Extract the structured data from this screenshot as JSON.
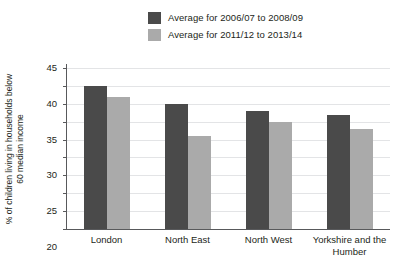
{
  "chart_data": {
    "type": "bar",
    "title": "",
    "xlabel": "",
    "ylabel": "% of children living in households below 60 median income",
    "ylim": [
      0,
      45
    ],
    "ytick_step": 5,
    "yticks": [
      "45",
      "40",
      "35",
      "30",
      "25",
      "20",
      "15",
      "10",
      "5",
      "0"
    ],
    "grid": true,
    "legend_position": "top-center",
    "categories": [
      "London",
      "North East",
      "North West",
      "Yorkshire and the Humber"
    ],
    "series": [
      {
        "name": "Average for 2006/07 to 2008/09",
        "color": "#4a4a4a",
        "values": [
          40,
          35,
          33,
          32
        ]
      },
      {
        "name": "Average for 2011/12 to 2013/14",
        "color": "#aaaaaa",
        "values": [
          37,
          26,
          30,
          28
        ]
      }
    ]
  },
  "axis": {
    "y_title": "% of children living in households below 60 median income"
  },
  "colors": {
    "series_1": "#4a4a4a",
    "series_2": "#aaaaaa",
    "axis_line": "#58595b",
    "gridline": "#e3e4e6",
    "text": "#231f20",
    "background": "#ffffff"
  }
}
